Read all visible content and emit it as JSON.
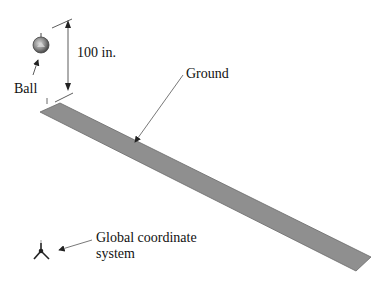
{
  "labels": {
    "dimension": "100 in.",
    "ball": "Ball",
    "ground": "Ground",
    "coord_line1": "Global coordinate",
    "coord_line2": "system"
  },
  "colors": {
    "ground_fill": "#8f8f8f",
    "ground_edge": "#6a6a6a",
    "ball_fill": "#7a7a7a",
    "line": "#333333"
  }
}
